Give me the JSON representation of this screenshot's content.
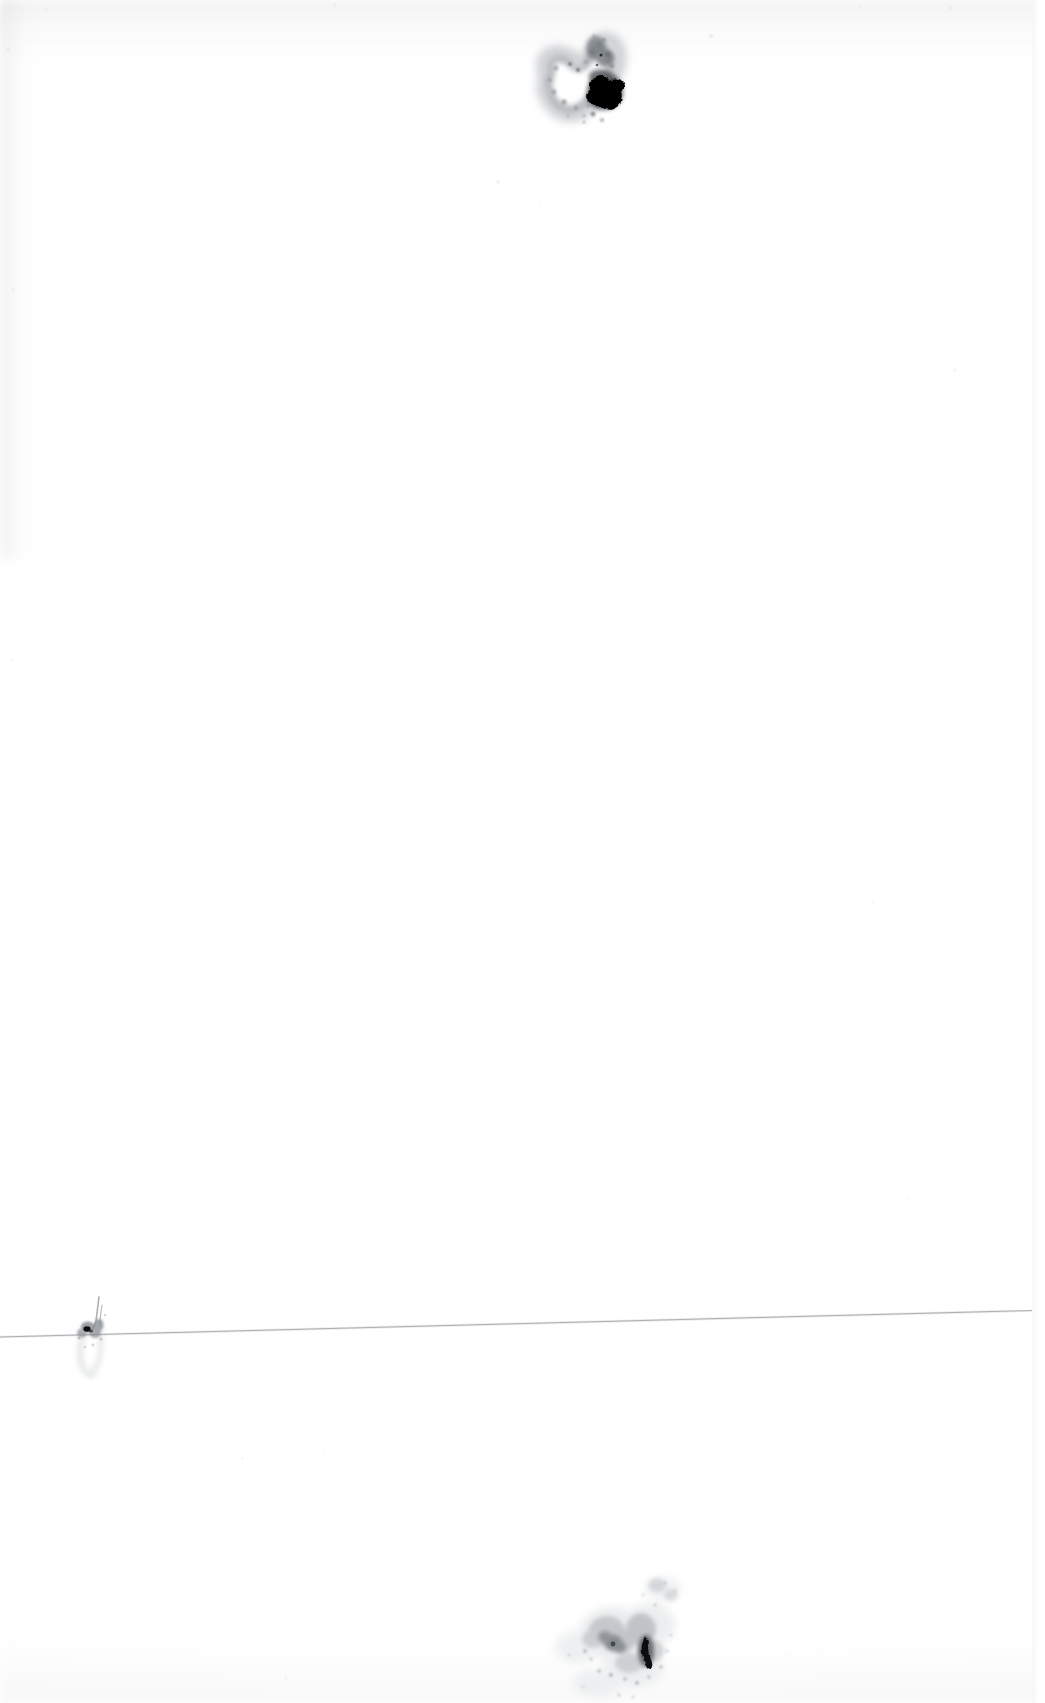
{
  "document": {
    "kind": "scanned-page",
    "page_label": "",
    "body_text": "",
    "background_color": "#ffffff",
    "ink_color": "#000000",
    "smudge_color": "#9aa0a6"
  },
  "canvas": {
    "width": 1045,
    "height": 1703
  },
  "marks": {
    "top_blot": {
      "name": "ink-blot",
      "center_x": 588,
      "center_y": 93,
      "core_color": "#000000",
      "halo_color": "#b9bcc0"
    },
    "bottom_mark": {
      "name": "ink-mark",
      "center_x": 606,
      "center_y": 1626,
      "core_color": "#0a0a0a",
      "halo_color": "#c2c5c9"
    },
    "left_smudge": {
      "name": "ink-smudge",
      "center_x": 88,
      "center_y": 1332,
      "core_color": "#111111",
      "halo_color": "#c8cbcf"
    }
  },
  "rule_line": {
    "name": "horizontal-rule",
    "x_start": 0,
    "y_start": 1337,
    "x_end": 1032,
    "y_end": 1310,
    "color": "#b4b7bb"
  },
  "page_edge": {
    "name": "page-edge",
    "x": 1032,
    "color": "#f5f6f7"
  },
  "specks": [
    {
      "x": 711,
      "y": 36,
      "r": 2.0,
      "o": 0.38
    },
    {
      "x": 498,
      "y": 182,
      "r": 2.0,
      "o": 0.26
    },
    {
      "x": 540,
      "y": 203,
      "r": 1.4,
      "o": 0.2
    },
    {
      "x": 955,
      "y": 370,
      "r": 1.6,
      "o": 0.18
    },
    {
      "x": 1000,
      "y": 362,
      "r": 1.3,
      "o": 0.16
    },
    {
      "x": 13,
      "y": 290,
      "r": 1.6,
      "o": 0.16
    },
    {
      "x": 594,
      "y": 462,
      "r": 1.4,
      "o": 0.15
    },
    {
      "x": 552,
      "y": 485,
      "r": 1.2,
      "o": 0.14
    },
    {
      "x": 11,
      "y": 660,
      "r": 1.5,
      "o": 0.16
    },
    {
      "x": 22,
      "y": 673,
      "r": 1.4,
      "o": 0.14
    },
    {
      "x": 320,
      "y": 628,
      "r": 1.3,
      "o": 0.13
    },
    {
      "x": 873,
      "y": 902,
      "r": 1.6,
      "o": 0.15
    },
    {
      "x": 907,
      "y": 1197,
      "r": 1.5,
      "o": 0.15
    },
    {
      "x": 324,
      "y": 1452,
      "r": 1.4,
      "o": 0.18
    },
    {
      "x": 260,
      "y": 1452,
      "r": 1.3,
      "o": 0.16
    },
    {
      "x": 242,
      "y": 1458,
      "r": 1.5,
      "o": 0.2
    },
    {
      "x": 343,
      "y": 1492,
      "r": 1.3,
      "o": 0.14
    },
    {
      "x": 340,
      "y": 1548,
      "r": 1.4,
      "o": 0.16
    },
    {
      "x": 355,
      "y": 1550,
      "r": 1.2,
      "o": 0.14
    },
    {
      "x": 471,
      "y": 1513,
      "r": 1.3,
      "o": 0.13
    },
    {
      "x": 411,
      "y": 1619,
      "r": 1.4,
      "o": 0.14
    },
    {
      "x": 412,
      "y": 1490,
      "r": 1.2,
      "o": 0.12
    },
    {
      "x": 226,
      "y": 1646,
      "r": 1.4,
      "o": 0.15
    },
    {
      "x": 285,
      "y": 1678,
      "r": 1.5,
      "o": 0.18
    },
    {
      "x": 786,
      "y": 1654,
      "r": 1.4,
      "o": 0.15
    },
    {
      "x": 820,
      "y": 1652,
      "r": 1.2,
      "o": 0.13
    },
    {
      "x": 470,
      "y": 1587,
      "r": 1.3,
      "o": 0.13
    },
    {
      "x": 468,
      "y": 1555,
      "r": 1.2,
      "o": 0.12
    },
    {
      "x": 698,
      "y": 1580,
      "r": 1.3,
      "o": 0.12
    },
    {
      "x": 46,
      "y": 10,
      "r": 2.2,
      "o": 0.2
    },
    {
      "x": 8,
      "y": 50,
      "r": 1.8,
      "o": 0.18
    },
    {
      "x": 335,
      "y": 5,
      "r": 1.6,
      "o": 0.14
    },
    {
      "x": 950,
      "y": 8,
      "r": 1.8,
      "o": 0.16
    },
    {
      "x": 860,
      "y": 6,
      "r": 1.5,
      "o": 0.14
    },
    {
      "x": 418,
      "y": 182,
      "r": 1.2,
      "o": 0.11
    },
    {
      "x": 143,
      "y": 42,
      "r": 1.4,
      "o": 0.13
    }
  ]
}
